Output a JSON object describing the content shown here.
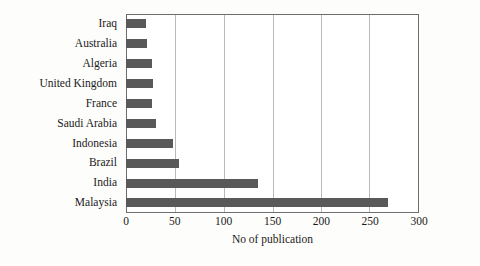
{
  "chart_data": {
    "type": "bar",
    "orientation": "horizontal",
    "title": "",
    "subtitle": "",
    "xlabel": "No of publication",
    "ylabel": "",
    "categories": [
      "Iraq",
      "Australia",
      "Algeria",
      "United Kingdom",
      "France",
      "Saudi Arabia",
      "Indonesia",
      "Brazil",
      "India",
      "Malaysia"
    ],
    "values": [
      20,
      21,
      27,
      28,
      27,
      31,
      48,
      54,
      135,
      268
    ],
    "xlim": [
      0,
      300
    ],
    "xticks": [
      0,
      50,
      100,
      150,
      200,
      250,
      300
    ],
    "xticklabels": [
      "0",
      "50",
      "100",
      "150",
      "200",
      "250",
      "300"
    ],
    "grid": "vertical",
    "legend": "none",
    "bar_color": "#595959",
    "axis_color": "#6e6e6e",
    "gridline_color": "#b9b9b9",
    "background": "#ffffff"
  }
}
